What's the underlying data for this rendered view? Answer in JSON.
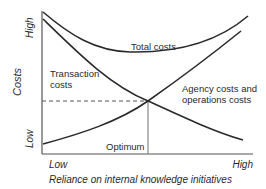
{
  "diagram": {
    "y_axis": {
      "title": "Costs",
      "high_label": "High",
      "low_label": "Low"
    },
    "x_axis": {
      "title": "Reliance on internal knowledge initiatives",
      "low_label": "Low",
      "high_label": "High"
    },
    "curves": [
      {
        "id": "total",
        "label": "Total costs",
        "shape": "U-shaped"
      },
      {
        "id": "transaction",
        "label_line1": "Transaction",
        "label_line2": "costs",
        "shape": "decreasing"
      },
      {
        "id": "agency",
        "label_line1": "Agency costs and",
        "label_line2": "operations costs",
        "shape": "increasing"
      }
    ],
    "optimum": {
      "label": "Optimum",
      "description": "intersection of transaction and agency cost curves"
    },
    "colors": {
      "line": "#2a2a2a",
      "axis": "#555555",
      "guide": "#777777"
    }
  }
}
